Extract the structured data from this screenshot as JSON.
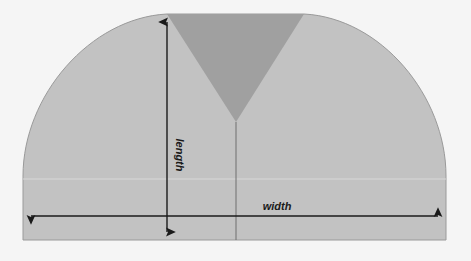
{
  "diagram": {
    "background_color": "#f5f5f5",
    "labels": {
      "length": "length",
      "width": "width"
    },
    "colors": {
      "body_fill": "#c2c2c2",
      "notch_fill": "#a0a0a0",
      "outline": "#9a9a9a",
      "arrow": "#1a1a1a",
      "center_line": "#6f6f6f",
      "highlight_line": "#d8d8d8"
    },
    "shapes": [
      {
        "name": "body",
        "description": "Rounded dome body with flat top and flat bottom",
        "fill": "#c2c2c2"
      },
      {
        "name": "notch",
        "description": "Downward pointing V wedge cut from the top centre",
        "fill": "#a0a0a0"
      }
    ],
    "dimensions": [
      {
        "name": "length",
        "label": "length",
        "orientation": "vertical",
        "arrow_heads": "both",
        "x": 167,
        "y_top": 16,
        "y_bottom": 238
      },
      {
        "name": "width",
        "label": "width",
        "orientation": "horizontal",
        "arrow_heads": "both",
        "y": 216,
        "x_left": 23,
        "x_right": 446
      }
    ],
    "guides": [
      {
        "name": "center-line",
        "orientation": "vertical",
        "x": 236,
        "y_top": 122,
        "y_bottom": 240
      },
      {
        "name": "highlight-line",
        "orientation": "horizontal",
        "y": 179
      }
    ]
  }
}
